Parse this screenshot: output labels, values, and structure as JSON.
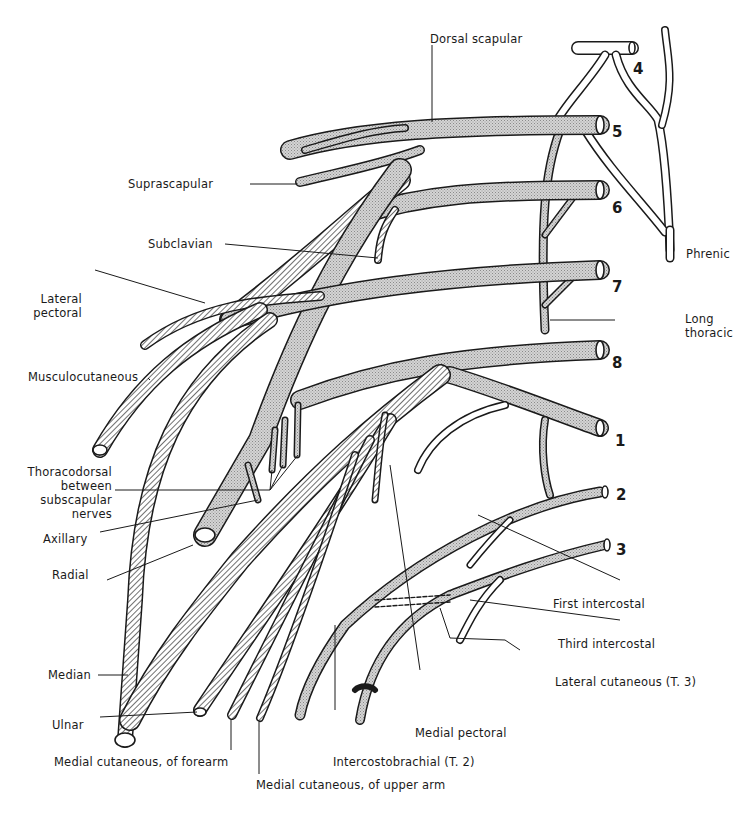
{
  "figure": {
    "root_numbers": [
      "4",
      "5",
      "6",
      "7",
      "8",
      "1",
      "2",
      "3"
    ],
    "labels": {
      "dorsal_scapular": "Dorsal scapular",
      "suprascapular": "Suprascapular",
      "subclavian": "Subclavian",
      "phrenic": "Phrenic",
      "lateral_pectoral_1": "Lateral",
      "lateral_pectoral_2": "pectoral",
      "long_thoracic_1": "Long",
      "long_thoracic_2": "thoracic",
      "musculocutaneous": "Musculocutaneous",
      "thoracodorsal_1": "Thoracodorsal",
      "thoracodorsal_2": "between",
      "thoracodorsal_3": "subscapular",
      "thoracodorsal_4": "nerves",
      "axillary": "Axillary",
      "radial": "Radial",
      "first_intercostal": "First intercostal",
      "third_intercostal": "Third intercostal",
      "lateral_cutaneous_t3": "Lateral cutaneous (T. 3)",
      "median": "Median",
      "ulnar": "Ulnar",
      "medial_pectoral": "Medial pectoral",
      "medial_cutaneous_forearm": "Medial cutaneous, of forearm",
      "intercostobrachial_t2": "Intercostobrachial (T. 2)",
      "medial_cutaneous_upper_arm": "Medial cutaneous, of upper arm"
    },
    "legend_patterns": {
      "stippled": "root/trunk/posterior fibers",
      "hatched": "anterior division fibers",
      "open": "cervical/intercostal nerves"
    },
    "colors": {
      "ink": "#1a1a1a",
      "stipple": "#c8c8c8",
      "paper": "#ffffff"
    }
  }
}
